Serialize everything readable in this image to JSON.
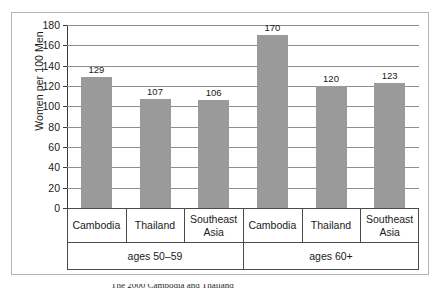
{
  "chart_data": {
    "type": "bar",
    "title": "",
    "xlabel": "",
    "ylabel": "Women per 100 Men",
    "ylim": [
      0,
      180
    ],
    "ytick_step": 20,
    "ytick_labels": [
      "180",
      "160",
      "140",
      "120",
      "100",
      "80",
      "60",
      "40",
      "20",
      "0"
    ],
    "grid": true,
    "legend": "none",
    "categories": [
      "Cambodia",
      "Thailand",
      "Southeast Asia",
      "Cambodia",
      "Thailand",
      "Southeast Asia"
    ],
    "values": [
      129,
      107,
      106,
      170,
      120,
      123
    ],
    "value_labels": [
      "129",
      "107",
      "106",
      "170",
      "120",
      "123"
    ],
    "groups": [
      {
        "label": "ages 50–59",
        "members": [
          "Cambodia",
          "Thailand",
          "Southeast Asia"
        ]
      },
      {
        "label": "ages 60+",
        "members": [
          "Cambodia",
          "Thailand",
          "Southeast Asia"
        ]
      }
    ],
    "bar_color": "#9a9a9a",
    "axis_color": "#3c3c3c",
    "gridline_color": "#8e8e8e"
  },
  "axis": {
    "y_title": "Women per 100 Men",
    "ticks": [
      {
        "label": "180",
        "value": 180
      },
      {
        "label": "160",
        "value": 160
      },
      {
        "label": "140",
        "value": 140
      },
      {
        "label": "120",
        "value": 120
      },
      {
        "label": "100",
        "value": 100
      },
      {
        "label": "80",
        "value": 80
      },
      {
        "label": "60",
        "value": 60
      },
      {
        "label": "40",
        "value": 40
      },
      {
        "label": "20",
        "value": 20
      },
      {
        "label": "0",
        "value": 0
      }
    ]
  },
  "bars": [
    {
      "label": "Cambodia",
      "value": 129,
      "value_label": "129"
    },
    {
      "label": "Thailand",
      "value": 107,
      "value_label": "107"
    },
    {
      "label": "Southeast Asia",
      "value": 106,
      "value_label": "106"
    },
    {
      "label": "Cambodia",
      "value": 170,
      "value_label": "170"
    },
    {
      "label": "Thailand",
      "value": 120,
      "value_label": "120"
    },
    {
      "label": "Southeast Asia",
      "value": 123,
      "value_label": "123"
    }
  ],
  "category_table": {
    "row1": [
      "Cambodia",
      "Thailand",
      "Southeast Asia",
      "Cambodia",
      "Thailand",
      "Southeast Asia"
    ],
    "row2": [
      "ages 50–59",
      "ages 60+"
    ]
  },
  "caption": {
    "text": "The 2000 Cambodia and Thailand"
  }
}
